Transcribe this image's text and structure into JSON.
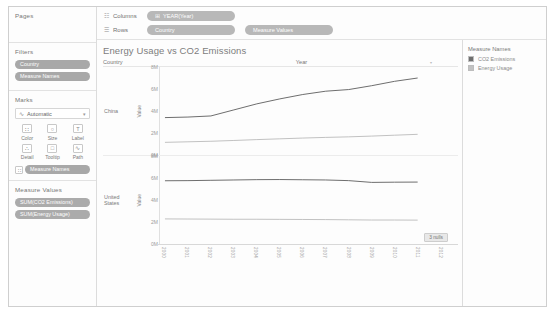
{
  "sidebar": {
    "pages": {
      "title": "Pages"
    },
    "filters": {
      "title": "Filters",
      "pills": [
        {
          "label": "Country"
        },
        {
          "label": "Measure Names"
        }
      ]
    },
    "marks": {
      "title": "Marks",
      "type_glyph": "∿",
      "type_label": "Automatic",
      "caret": "▾",
      "buttons": [
        {
          "label": "Color",
          "glyph": "∷"
        },
        {
          "label": "Size",
          "glyph": "○"
        },
        {
          "label": "Label",
          "glyph": "T"
        },
        {
          "label": "Detail",
          "glyph": "∴"
        },
        {
          "label": "Tooltip",
          "glyph": "□"
        },
        {
          "label": "Path",
          "glyph": "∿"
        }
      ],
      "color_pill": {
        "glyph": "∷",
        "label": "Measure Names"
      }
    },
    "measure_values": {
      "title": "Measure Values",
      "pills": [
        {
          "label": "SUM(CO2 Emissions)"
        },
        {
          "label": "SUM(Energy Usage)"
        }
      ]
    }
  },
  "shelves": {
    "columns": {
      "icon": "☷",
      "name": "Columns",
      "pills": [
        {
          "prefix": "⊞",
          "label": "YEAR(Year)"
        }
      ]
    },
    "rows": {
      "icon": "☰",
      "name": "Rows",
      "pills": [
        {
          "prefix": "",
          "label": "Country"
        },
        {
          "prefix": "",
          "label": "Measure Values"
        }
      ]
    }
  },
  "viz": {
    "title": "Energy Usage vs CO2 Emissions",
    "header_country": "Country",
    "header_year": "Year",
    "axis_title": "Value",
    "nulls_badge": "3 nulls",
    "rows": [
      {
        "label": "China"
      },
      {
        "label": "United States"
      }
    ]
  },
  "legend": {
    "title": "Measure Names",
    "items": [
      {
        "label": "CO2 Emissions",
        "color": "#6e6e6e"
      },
      {
        "label": "Energy Usage",
        "color": "#c2c2c2"
      }
    ]
  },
  "chart_data": {
    "type": "line",
    "title": "Energy Usage vs CO2 Emissions",
    "xlabel": "Year",
    "ylabel": "Value",
    "ylim": [
      0,
      8000000
    ],
    "ytick_labels": [
      "8M",
      "6M",
      "4M",
      "2M",
      "0M"
    ],
    "ytick_values": [
      8000000,
      6000000,
      4000000,
      2000000,
      0
    ],
    "grid": false,
    "legend_position": "right",
    "x": [
      2000,
      2001,
      2002,
      2003,
      2004,
      2005,
      2006,
      2007,
      2008,
      2009,
      2010,
      2011,
      2012
    ],
    "x_tick_labels": [
      "2000",
      "2001",
      "2002",
      "2003",
      "2004",
      "2005",
      "2006",
      "2007",
      "2008",
      "2009",
      "2010",
      "2011",
      "2012"
    ],
    "panels": [
      {
        "name": "China",
        "series": [
          {
            "name": "CO2 Emissions",
            "color": "#6e6e6e",
            "values": [
              3400000,
              3450000,
              3550000,
              4100000,
              4650000,
              5100000,
              5500000,
              5800000,
              5950000,
              6300000,
              6700000,
              7000000,
              null
            ]
          },
          {
            "name": "Energy Usage",
            "color": "#c2c2c2",
            "values": [
              1150000,
              1200000,
              1250000,
              1320000,
              1400000,
              1470000,
              1540000,
              1600000,
              1650000,
              1720000,
              1800000,
              1880000,
              null
            ]
          }
        ]
      },
      {
        "name": "United States",
        "series": [
          {
            "name": "CO2 Emissions",
            "color": "#6e6e6e",
            "values": [
              5750000,
              5760000,
              5790000,
              5820000,
              5850000,
              5860000,
              5840000,
              5820000,
              5760000,
              5600000,
              5620000,
              5630000,
              null
            ]
          },
          {
            "name": "Energy Usage",
            "color": "#c2c2c2",
            "values": [
              2280000,
              2270000,
              2260000,
              2250000,
              2250000,
              2240000,
              2230000,
              2220000,
              2200000,
              2180000,
              2180000,
              2170000,
              null
            ]
          }
        ]
      }
    ]
  }
}
